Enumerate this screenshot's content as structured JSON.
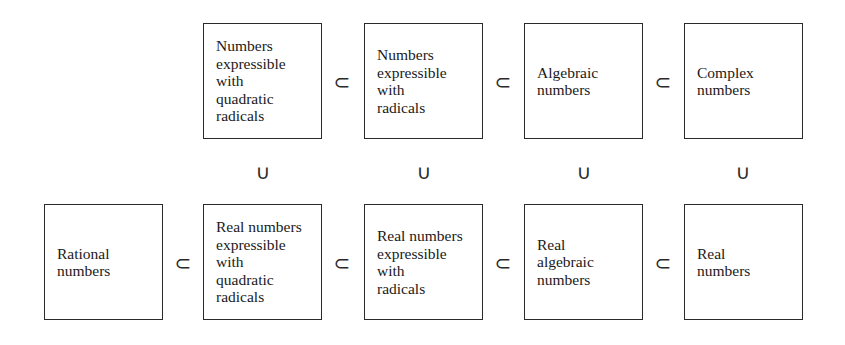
{
  "diagram": {
    "top_row": [
      {
        "label": "Numbers\nexpressible\nwith\nquadratic\nradicals"
      },
      {
        "label": "Numbers\nexpressible\nwith\nradicals"
      },
      {
        "label": "Algebraic\nnumbers"
      },
      {
        "label": "Complex\nnumbers"
      }
    ],
    "bottom_row": [
      {
        "label": "Rational\nnumbers"
      },
      {
        "label": "Real numbers\nexpressible\nwith\nquadratic\nradicals"
      },
      {
        "label": "Real numbers\nexpressible\nwith\nradicals"
      },
      {
        "label": "Real\nalgebraic\nnumbers"
      },
      {
        "label": "Real\nnumbers"
      }
    ],
    "subset_symbol": "⊂",
    "vertical_symbol": "∪"
  }
}
